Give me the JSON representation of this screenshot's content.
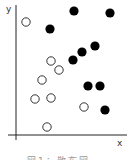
{
  "chart_data": {
    "type": "scatter",
    "title": "",
    "xlabel": "x",
    "ylabel": "y",
    "grid": false,
    "legend": null,
    "axis_origin_px": {
      "x": 16,
      "y": 135
    },
    "series": [
      {
        "name": "filled",
        "marker": "filled-circle",
        "color": "#000000",
        "points": [
          [
            74,
            11
          ],
          [
            110,
            13
          ],
          [
            50,
            29
          ],
          [
            95,
            46
          ],
          [
            82,
            52
          ],
          [
            73,
            60
          ],
          [
            88,
            86
          ],
          [
            100,
            86
          ],
          [
            105,
            110
          ]
        ]
      },
      {
        "name": "open",
        "marker": "open-circle",
        "color": "#000000",
        "points": [
          [
            26,
            22
          ],
          [
            51,
            61
          ],
          [
            59,
            70
          ],
          [
            42,
            80
          ],
          [
            51,
            98
          ],
          [
            35,
            99
          ],
          [
            84,
            107
          ],
          [
            47,
            127
          ]
        ]
      }
    ]
  },
  "labels": {
    "x_axis": "x",
    "y_axis": "y",
    "caption": "図1：散布図"
  },
  "colors": {
    "axis": "#222222",
    "marker": "#000000",
    "background": "#ffffff"
  }
}
